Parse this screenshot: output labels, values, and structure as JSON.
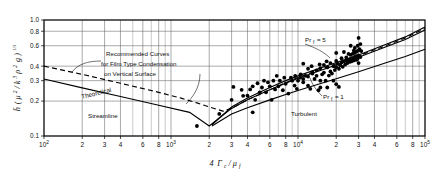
{
  "figure": {
    "background": "#ffffff",
    "line_color": "#000000",
    "marker_color": "#000000"
  },
  "chart_data": {
    "type": "line",
    "title": "",
    "xlabel": "4 Γc / μf",
    "ylabel": "h̄ ( μ² / k³ρ² g )^(1/3)",
    "xscale": "log",
    "yscale": "log",
    "xlim": [
      100,
      100000
    ],
    "ylim": [
      0.1,
      1.0
    ],
    "grid": true,
    "xticks": [
      100,
      200,
      300,
      400,
      600,
      800,
      1000,
      2000,
      3000,
      4000,
      6000,
      8000,
      10000,
      20000,
      30000,
      40000,
      60000,
      80000,
      100000
    ],
    "xticklabels": [
      "10²",
      "2",
      "3",
      "4",
      "6",
      "8",
      "10³",
      "2",
      "3",
      "4",
      "6",
      "8",
      "10⁴",
      "2",
      "3",
      "4",
      "6",
      "8",
      "10⁵"
    ],
    "yticks": [
      0.1,
      0.2,
      0.3,
      0.4,
      0.6,
      0.8,
      1.0
    ],
    "yticklabels": [
      "0.1",
      "0.2",
      "0.3",
      "0.4",
      "0.6",
      "0.8",
      "1.0"
    ],
    "series": [
      {
        "name": "Theoretical Streamline / Recommended solid",
        "style": "solid",
        "points": [
          [
            100,
            0.31
          ],
          [
            200,
            0.26
          ],
          [
            400,
            0.219
          ],
          [
            800,
            0.184
          ],
          [
            1400,
            0.16
          ],
          [
            2000,
            0.122
          ],
          [
            2400,
            0.143
          ],
          [
            3000,
            0.173
          ],
          [
            4000,
            0.205
          ],
          [
            6000,
            0.25
          ],
          [
            8000,
            0.285
          ],
          [
            10000,
            0.315
          ],
          [
            20000,
            0.41
          ],
          [
            30000,
            0.478
          ],
          [
            50000,
            0.59
          ],
          [
            70000,
            0.68
          ],
          [
            100000,
            0.82
          ]
        ]
      },
      {
        "name": "Recommended dashed (Pr_f = 5 upper)",
        "style": "dashed",
        "points": [
          [
            100,
            0.4
          ],
          [
            200,
            0.34
          ],
          [
            400,
            0.285
          ],
          [
            800,
            0.238
          ],
          [
            1200,
            0.212
          ],
          [
            1600,
            0.193
          ],
          [
            2000,
            0.178
          ],
          [
            2600,
            0.163
          ],
          [
            3200,
            0.18
          ],
          [
            4000,
            0.205
          ],
          [
            6000,
            0.25
          ],
          [
            8000,
            0.288
          ],
          [
            10000,
            0.32
          ],
          [
            20000,
            0.42
          ],
          [
            30000,
            0.492
          ],
          [
            50000,
            0.605
          ],
          [
            70000,
            0.7
          ],
          [
            100000,
            0.845
          ]
        ]
      },
      {
        "name": "Pr_f = 5 curve",
        "style": "solid",
        "points": [
          [
            2100,
            0.125
          ],
          [
            3000,
            0.178
          ],
          [
            4000,
            0.213
          ],
          [
            6000,
            0.262
          ],
          [
            8000,
            0.3
          ],
          [
            10000,
            0.33
          ],
          [
            20000,
            0.43
          ],
          [
            30000,
            0.5
          ],
          [
            50000,
            0.62
          ],
          [
            70000,
            0.715
          ],
          [
            100000,
            0.87
          ]
        ]
      },
      {
        "name": "Pr_f = 1 curve",
        "style": "solid",
        "points": [
          [
            2100,
            0.122
          ],
          [
            3000,
            0.155
          ],
          [
            4000,
            0.175
          ],
          [
            6000,
            0.205
          ],
          [
            8000,
            0.228
          ],
          [
            10000,
            0.247
          ],
          [
            20000,
            0.312
          ],
          [
            30000,
            0.358
          ],
          [
            50000,
            0.43
          ],
          [
            70000,
            0.485
          ],
          [
            100000,
            0.56
          ]
        ]
      }
    ],
    "scatter": {
      "name": "Experimental data",
      "marker": "filled-circle",
      "points": [
        [
          1600,
          0.122
        ],
        [
          2400,
          0.155
        ],
        [
          3000,
          0.205
        ],
        [
          3100,
          0.265
        ],
        [
          3600,
          0.25
        ],
        [
          3700,
          0.222
        ],
        [
          4000,
          0.223
        ],
        [
          4200,
          0.252
        ],
        [
          4400,
          0.268
        ],
        [
          4400,
          0.16
        ],
        [
          4600,
          0.205
        ],
        [
          5000,
          0.238
        ],
        [
          5200,
          0.262
        ],
        [
          5600,
          0.238
        ],
        [
          5800,
          0.29
        ],
        [
          6000,
          0.268
        ],
        [
          6200,
          0.205
        ],
        [
          6400,
          0.3
        ],
        [
          6600,
          0.252
        ],
        [
          7000,
          0.268
        ],
        [
          7200,
          0.3
        ],
        [
          7600,
          0.248
        ],
        [
          8000,
          0.282
        ],
        [
          8400,
          0.232
        ],
        [
          9000,
          0.3
        ],
        [
          9400,
          0.272
        ],
        [
          9800,
          0.255
        ],
        [
          10000,
          0.3
        ],
        [
          10400,
          0.318
        ],
        [
          11000,
          0.29
        ],
        [
          11500,
          0.33
        ],
        [
          12000,
          0.272
        ],
        [
          12500,
          0.255
        ],
        [
          13000,
          0.355
        ],
        [
          13500,
          0.31
        ],
        [
          14000,
          0.33
        ],
        [
          14500,
          0.248
        ],
        [
          15000,
          0.262
        ],
        [
          15500,
          0.34
        ],
        [
          16000,
          0.352
        ],
        [
          16500,
          0.3
        ],
        [
          17000,
          0.39
        ],
        [
          17500,
          0.332
        ],
        [
          18000,
          0.36
        ],
        [
          18500,
          0.345
        ],
        [
          19000,
          0.4
        ],
        [
          19500,
          0.37
        ],
        [
          20000,
          0.392
        ],
        [
          20500,
          0.42
        ],
        [
          21000,
          0.38
        ],
        [
          21500,
          0.408
        ],
        [
          22000,
          0.43
        ],
        [
          22500,
          0.395
        ],
        [
          23000,
          0.44
        ],
        [
          23500,
          0.412
        ],
        [
          24000,
          0.45
        ],
        [
          24500,
          0.425
        ],
        [
          25000,
          0.455
        ],
        [
          25500,
          0.435
        ],
        [
          26000,
          0.462
        ],
        [
          26500,
          0.44
        ],
        [
          27000,
          0.47
        ],
        [
          27500,
          0.448
        ],
        [
          28000,
          0.48
        ],
        [
          28500,
          0.455
        ],
        [
          29000,
          0.488
        ],
        [
          29500,
          0.465
        ],
        [
          30000,
          0.495
        ],
        [
          26000,
          0.5
        ],
        [
          27000,
          0.512
        ],
        [
          28000,
          0.52
        ],
        [
          29000,
          0.535
        ],
        [
          30000,
          0.548
        ],
        [
          30500,
          0.56
        ],
        [
          28000,
          0.575
        ],
        [
          29500,
          0.6
        ],
        [
          31000,
          0.62
        ],
        [
          30000,
          0.7
        ],
        [
          26000,
          0.6
        ],
        [
          24000,
          0.475
        ],
        [
          22000,
          0.468
        ],
        [
          20000,
          0.445
        ],
        [
          18000,
          0.425
        ],
        [
          16000,
          0.41
        ],
        [
          15000,
          0.385
        ],
        [
          14000,
          0.368
        ],
        [
          13000,
          0.345
        ],
        [
          12000,
          0.325
        ],
        [
          11000,
          0.31
        ],
        [
          10500,
          0.34
        ],
        [
          12800,
          0.4
        ],
        [
          14800,
          0.415
        ],
        [
          16800,
          0.44
        ],
        [
          19000,
          0.3
        ],
        [
          20000,
          0.28
        ],
        [
          21000,
          0.265
        ],
        [
          17000,
          0.262
        ],
        [
          15000,
          0.3
        ],
        [
          12000,
          0.38
        ],
        [
          11000,
          0.42
        ],
        [
          9500,
          0.33
        ],
        [
          8800,
          0.318
        ],
        [
          7800,
          0.318
        ],
        [
          6800,
          0.33
        ],
        [
          5400,
          0.3
        ],
        [
          4800,
          0.285
        ],
        [
          20000,
          0.52
        ],
        [
          23000,
          0.53
        ],
        [
          25000,
          0.51
        ],
        [
          27500,
          0.545
        ],
        [
          29000,
          0.455
        ],
        [
          30000,
          0.425
        ],
        [
          31000,
          0.48
        ],
        [
          31500,
          0.54
        ]
      ]
    },
    "annotations": [
      {
        "id": "recommended",
        "lines": [
          "Recommended Curves",
          "for Film Type Condensation",
          "on Vertical Surface"
        ]
      },
      {
        "id": "theoretical",
        "text": "Theoretical"
      },
      {
        "id": "streamline",
        "text": "Streamline"
      },
      {
        "id": "turbulent",
        "text": "Turbulent"
      },
      {
        "id": "pr5",
        "text": "Pr",
        "sub": "f",
        "tail": "= 5"
      },
      {
        "id": "pr1",
        "text": "Pr",
        "sub": "f",
        "tail": "= 1"
      }
    ]
  },
  "axis": {
    "y_label_parts": {
      "h": "h̄",
      "open": "(",
      "mu": "μ",
      "mu_sup": "2",
      "slash": "/",
      "k": "k",
      "k_sup": "3",
      "rho": "ρ",
      "rho_sup": "2",
      "g": "g",
      "close": ")",
      "exp": "1/3"
    },
    "x_label_parts": {
      "four": "4",
      "gamma": "Γ",
      "gamma_sub": "c",
      "slash": "/",
      "mu": "μ",
      "mu_sub": "f"
    }
  }
}
